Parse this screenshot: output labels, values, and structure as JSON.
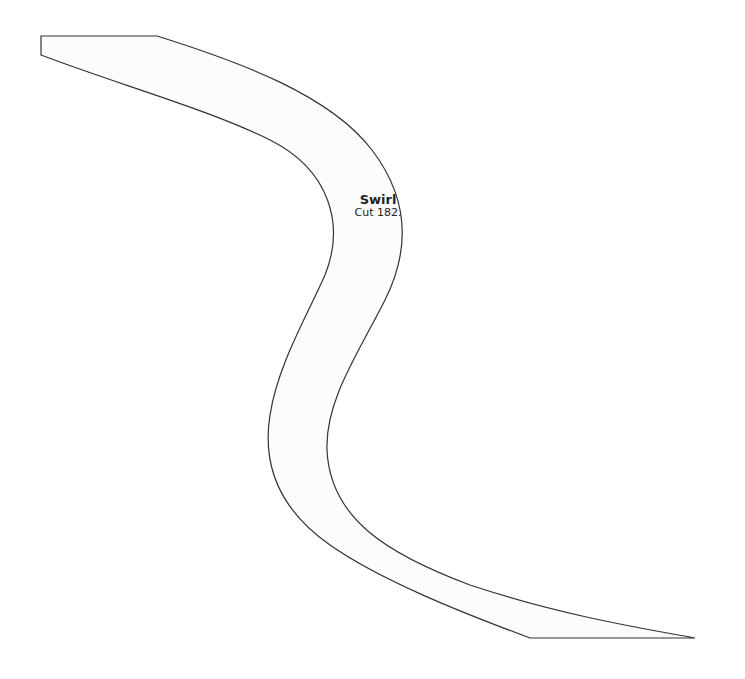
{
  "piece": {
    "name": "Swirl",
    "cut": "Cut 182.",
    "fill": "#fcfcfc",
    "stroke": "#333333"
  }
}
